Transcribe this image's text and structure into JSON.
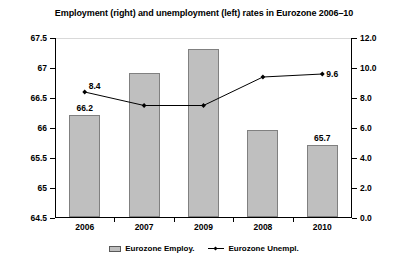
{
  "chart_data": {
    "type": "bar",
    "title": "Employment (right) and unemployment (left) rates in Eurozone 2006–10",
    "categories": [
      "2006",
      "2007",
      "2009",
      "2008",
      "2010"
    ],
    "xlabel": "",
    "grid": false,
    "legend_position": "bottom",
    "axes": {
      "left": {
        "label": "",
        "ylim": [
          64.5,
          67.5
        ],
        "step": 0.5,
        "ticks": [
          "64.5",
          "65",
          "65.5",
          "66",
          "66.5",
          "67",
          "67.5"
        ],
        "tick_values": [
          64.5,
          65,
          65.5,
          66,
          66.5,
          67,
          67.5
        ]
      },
      "right": {
        "label": "",
        "ylim": [
          0.0,
          12.0
        ],
        "step": 2.0,
        "ticks": [
          "0.0",
          "2.0",
          "4.0",
          "6.0",
          "8.0",
          "10.0",
          "12.0"
        ],
        "tick_values": [
          0,
          2,
          4,
          6,
          8,
          10,
          12
        ]
      }
    },
    "series": [
      {
        "name": "Eurozone Employ.",
        "type": "bar",
        "axis": "left",
        "color": "#bfbfbf",
        "border_color": "#808080",
        "values": [
          66.2,
          66.9,
          67.3,
          65.95,
          65.7
        ],
        "point_labels": [
          "66.2",
          "",
          "",
          "",
          "65.7"
        ]
      },
      {
        "name": "Eurozone Unempl.",
        "type": "line",
        "axis": "right",
        "color": "#000000",
        "values": [
          8.4,
          7.5,
          7.5,
          9.4,
          9.6
        ],
        "point_labels": [
          "8.4",
          "",
          "",
          "",
          "9.6"
        ]
      }
    ]
  },
  "legend": {
    "items": [
      {
        "label": "Eurozone Employ.",
        "marker": "bar-swatch"
      },
      {
        "label": "Eurozone Unempl.",
        "marker": "line-marker"
      }
    ]
  }
}
